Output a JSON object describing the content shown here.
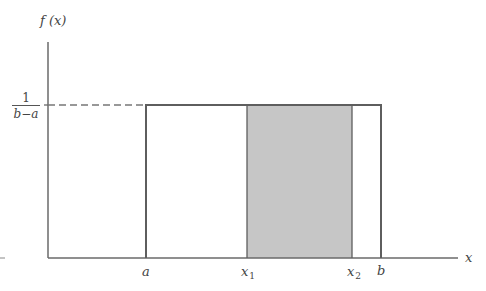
{
  "diagram": {
    "y_axis_label": "f (x)",
    "x_axis_label": "x",
    "density_label": {
      "numerator": "1",
      "denominator": "b−a"
    },
    "x_ticks": [
      {
        "label": "a",
        "sub": ""
      },
      {
        "label": "x",
        "sub": "1"
      },
      {
        "label": "x",
        "sub": "2"
      },
      {
        "label": "b",
        "sub": ""
      }
    ],
    "colors": {
      "line": "#666666",
      "shade": "#c6c6c6",
      "dash": "#777777"
    },
    "shaded_interval": [
      "x1",
      "x2"
    ]
  }
}
